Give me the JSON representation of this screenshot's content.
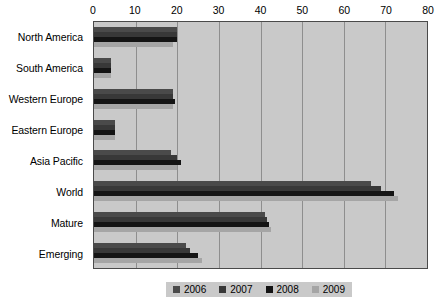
{
  "chart_data": {
    "type": "bar",
    "orientation": "horizontal",
    "title": "",
    "xlabel": "",
    "ylabel": "",
    "xlim": [
      0,
      80
    ],
    "xticks": [
      0,
      10,
      20,
      30,
      40,
      50,
      60,
      70,
      80
    ],
    "grid": true,
    "legend_position": "bottom",
    "categories": [
      "North America",
      "South America",
      "Western Europe",
      "Eastern Europe",
      "Asia Pacific",
      "World",
      "Mature",
      "Emerging"
    ],
    "series": [
      {
        "name": "2006",
        "color": "#4a4a4a",
        "values": [
          20,
          4,
          19,
          5,
          18.5,
          66.5,
          41,
          22
        ]
      },
      {
        "name": "2007",
        "color": "#383838",
        "values": [
          20,
          4,
          19,
          5,
          20,
          69,
          41.5,
          23
        ]
      },
      {
        "name": "2008",
        "color": "#141414",
        "values": [
          20,
          4,
          19.5,
          5,
          21,
          72,
          42,
          25
        ]
      },
      {
        "name": "2009",
        "color": "#a5a5a5",
        "values": [
          19,
          4,
          19,
          5,
          20,
          73,
          42.5,
          26
        ]
      }
    ]
  },
  "legend": {
    "items": [
      {
        "label": "2006",
        "color": "#4a4a4a"
      },
      {
        "label": "2007",
        "color": "#383838"
      },
      {
        "label": "2008",
        "color": "#141414"
      },
      {
        "label": "2009",
        "color": "#a5a5a5"
      }
    ]
  },
  "colors": {
    "plot_background": "#c9c9c9",
    "gridline": "#8e8e8e",
    "axis_border": "#4a4a4a",
    "page_background": "#ffffff",
    "text": "#000000"
  },
  "background_bleed": [
    {
      "text": "the path to protect",
      "x": 200,
      "y": 30
    },
    {
      "text": "the countries that",
      "x": 205,
      "y": 45
    },
    {
      "text": "some of the  ity",
      "x": 198,
      "y": 58
    },
    {
      "text": "of growth",
      "x": 232,
      "y": 72
    },
    {
      "text": "find mobile",
      "x": 206,
      "y": 100
    },
    {
      "text": "their economic",
      "x": 204,
      "y": 114
    },
    {
      "text": "and other sectors",
      "x": 199,
      "y": 130
    },
    {
      "text": "it and  ent  a as the",
      "x": 196,
      "y": 146
    }
  ]
}
